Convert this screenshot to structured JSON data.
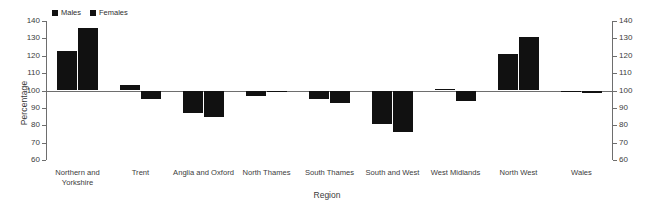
{
  "chart_data": {
    "type": "bar",
    "title": "",
    "xlabel": "Region",
    "ylabel": "Percentage",
    "ylim": [
      60,
      140
    ],
    "ytick_step": 10,
    "yticks": [
      140,
      130,
      120,
      110,
      100,
      90,
      80,
      70,
      60
    ],
    "baseline": 100,
    "grid": false,
    "legend_position": "top-left",
    "dual_y_axis": true,
    "categories": [
      "Northern and Yorkshire",
      "Trent",
      "Anglia and Oxford",
      "North Thames",
      "South Thames",
      "South and West",
      "West Midlands",
      "North West",
      "Wales"
    ],
    "category_lines": [
      [
        "Northern and",
        "Yorkshire"
      ],
      [
        "Trent"
      ],
      [
        "Anglia and Oxford"
      ],
      [
        "North Thames"
      ],
      [
        "South Thames"
      ],
      [
        "South and West"
      ],
      [
        "West Midlands"
      ],
      [
        "North West"
      ],
      [
        "Wales"
      ]
    ],
    "series": [
      {
        "name": "Males",
        "color": "#111111",
        "values": [
          123,
          103,
          87,
          97,
          95,
          81,
          101,
          121,
          99
        ]
      },
      {
        "name": "Females",
        "color": "#111111",
        "values": [
          136,
          95,
          85,
          100,
          93,
          76,
          94,
          131,
          98.5
        ]
      }
    ]
  },
  "legend": {
    "items": [
      {
        "label": "Males"
      },
      {
        "label": "Females"
      }
    ]
  },
  "axes": {
    "y_label": "Percentage",
    "x_label": "Region",
    "y_tick_labels": [
      "140",
      "130",
      "120",
      "110",
      "100",
      "90",
      "80",
      "70",
      "60"
    ]
  }
}
